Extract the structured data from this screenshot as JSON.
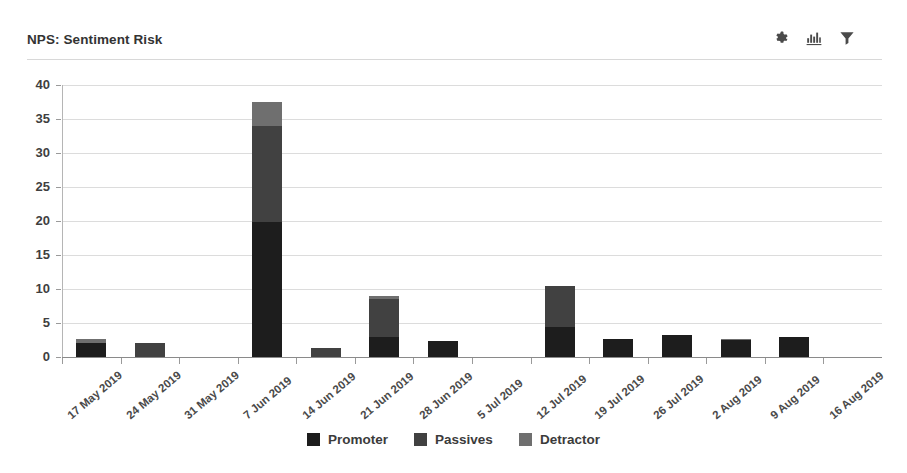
{
  "header": {
    "title": "NPS: Sentiment Risk",
    "tools": [
      {
        "name": "settings-icon",
        "label": "Settings"
      },
      {
        "name": "bar-chart-icon",
        "label": "Chart type"
      },
      {
        "name": "filter-icon",
        "label": "Filter"
      }
    ]
  },
  "colors": {
    "promoter": "#1d1d1d",
    "passives": "#414141",
    "detractor": "#6f6f6f",
    "gridline": "#dcdcdc",
    "axis": "#8a8a8a",
    "text": "#3f3f3f"
  },
  "chart_data": {
    "type": "bar",
    "stacked": true,
    "title": "NPS: Sentiment Risk",
    "xlabel": "",
    "ylabel": "",
    "ylim": [
      0,
      40
    ],
    "yticks": [
      0,
      5,
      10,
      15,
      20,
      25,
      30,
      35,
      40
    ],
    "grid": true,
    "legend_position": "bottom",
    "categories": [
      "17 May 2019",
      "24 May 2019",
      "31 May 2019",
      "7 Jun 2019",
      "14 Jun 2019",
      "21 Jun 2019",
      "28 Jun 2019",
      "5 Jul 2019",
      "12 Jul 2019",
      "19 Jul 2019",
      "26 Jul 2019",
      "2 Aug 2019",
      "9 Aug 2019",
      "16 Aug 2019"
    ],
    "series": [
      {
        "name": "Promoter",
        "color": "#1d1d1d",
        "values": [
          2,
          0,
          0,
          19.8,
          0,
          3,
          2.3,
          0,
          4.5,
          2.6,
          3.2,
          2.5,
          3,
          0
        ]
      },
      {
        "name": "Passives",
        "color": "#414141",
        "values": [
          0,
          2,
          0,
          14.2,
          1.3,
          5.5,
          0,
          0,
          6,
          0,
          0,
          0,
          0,
          0
        ]
      },
      {
        "name": "Detractor",
        "color": "#6f6f6f",
        "values": [
          0.6,
          0,
          0,
          3.5,
          0,
          0.5,
          0,
          0,
          0,
          0,
          0,
          0.2,
          0,
          0
        ]
      }
    ],
    "totals": [
      2.6,
      2,
      0,
      37.5,
      1.3,
      9,
      2.3,
      0,
      10.5,
      2.6,
      3.2,
      2.7,
      3,
      0
    ]
  }
}
